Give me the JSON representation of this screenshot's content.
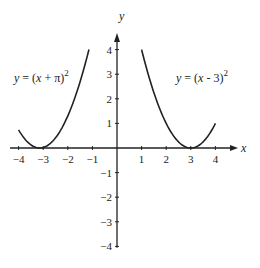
{
  "chart_data": {
    "type": "line",
    "title": "",
    "xlabel": "x",
    "ylabel": "y",
    "xlim": [
      -4,
      4
    ],
    "ylim": [
      -4,
      4
    ],
    "grid": false,
    "x_ticks": [
      -4,
      -3,
      -2,
      -1,
      1,
      2,
      3,
      4
    ],
    "y_ticks": [
      4,
      3,
      2,
      1,
      -1,
      -2,
      -3,
      -4
    ],
    "x_tick_labels": [
      "−4",
      "−3",
      "−2",
      "−1",
      "1",
      "2",
      "3",
      "4"
    ],
    "y_tick_labels": [
      "4",
      "3",
      "2",
      "1",
      "−1",
      "−2",
      "−3",
      "−4"
    ],
    "series": [
      {
        "name": "y = (x + π)^2",
        "function": "(x + pi)^2",
        "shift": -3.14159,
        "x_domain": [
          -4,
          -1.14
        ],
        "label_parts": [
          "y",
          " = (",
          "x",
          " + π)",
          "2"
        ]
      },
      {
        "name": "y = (x - 3)^2",
        "function": "(x - 3)^2",
        "shift": 3,
        "x_domain": [
          1,
          4
        ],
        "label_parts": [
          "y",
          " = (",
          "x",
          " - 3)",
          "2"
        ]
      }
    ]
  }
}
